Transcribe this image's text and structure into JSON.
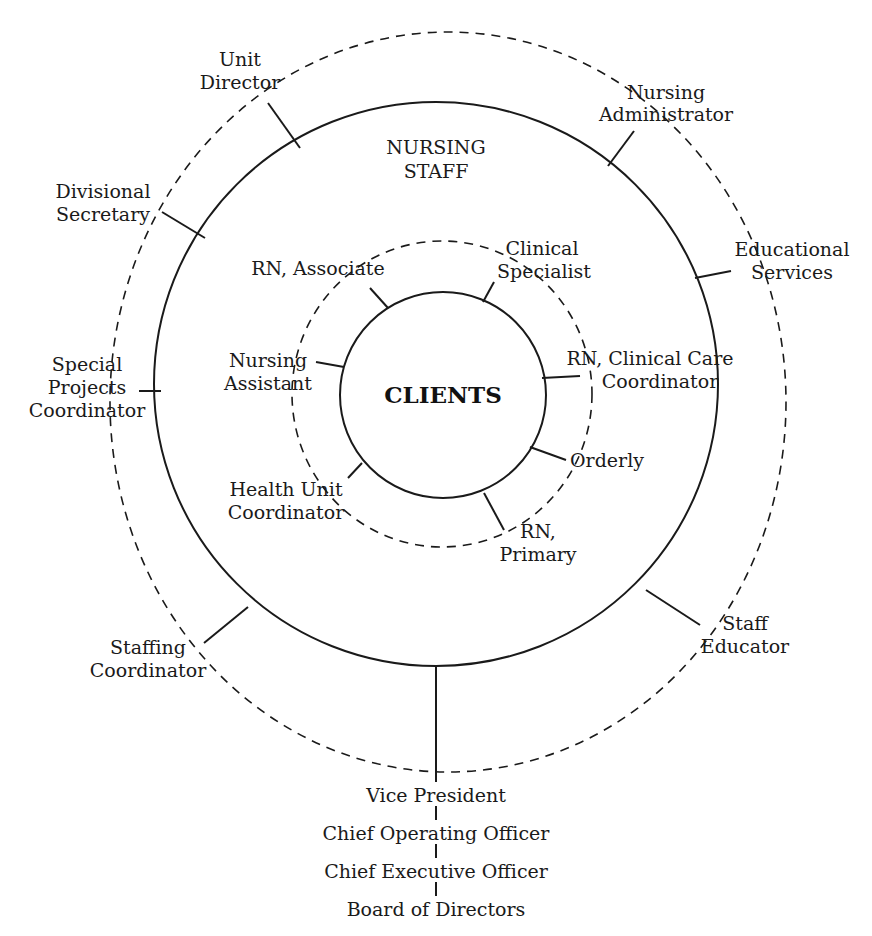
{
  "diagram": {
    "center": {
      "label": "CLIENTS"
    },
    "middle_ring": {
      "label_line1": "NURSING",
      "label_line2": "STAFF"
    },
    "inner_roles": [
      {
        "line1": "RN, Associate",
        "line2": ""
      },
      {
        "line1": "Clinical",
        "line2": "Specialist"
      },
      {
        "line1": "Nursing",
        "line2": "Assistant"
      },
      {
        "line1": "RN, Clinical Care",
        "line2": "Coordinator"
      },
      {
        "line1": "Orderly",
        "line2": ""
      },
      {
        "line1": "Health Unit",
        "line2": "Coordinator"
      },
      {
        "line1": "RN,",
        "line2": "Primary"
      }
    ],
    "outer_roles": [
      {
        "line1": "Unit",
        "line2": "Director",
        "line3": ""
      },
      {
        "line1": "Nursing",
        "line2": "Administrator",
        "line3": ""
      },
      {
        "line1": "Divisional",
        "line2": "Secretary",
        "line3": ""
      },
      {
        "line1": "Educational",
        "line2": "Services",
        "line3": ""
      },
      {
        "line1": "Special",
        "line2": "Projects",
        "line3": "Coordinator"
      },
      {
        "line1": "Staffing",
        "line2": "Coordinator",
        "line3": ""
      },
      {
        "line1": "Staff",
        "line2": "Educator",
        "line3": ""
      }
    ],
    "hierarchy": [
      "Vice President",
      "Chief Operating Officer",
      "Chief Executive Officer",
      "Board of Directors"
    ]
  }
}
